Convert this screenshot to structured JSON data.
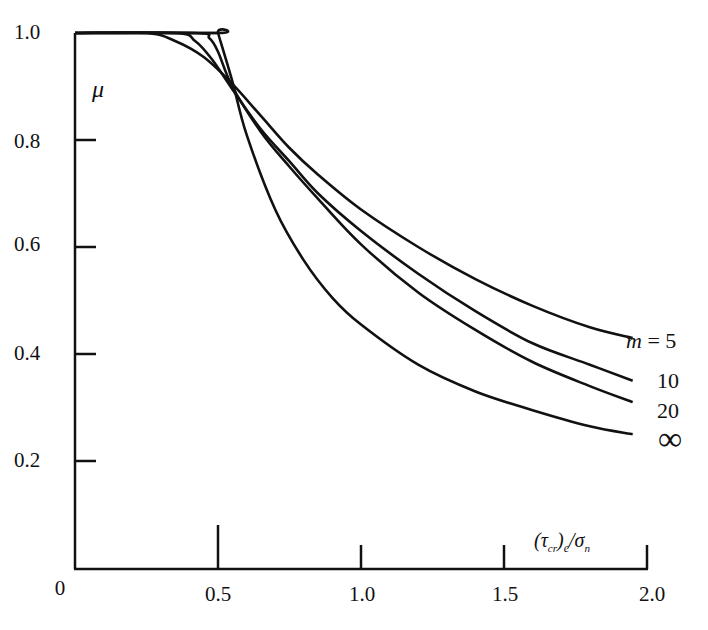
{
  "chart_data": {
    "type": "line",
    "title": "",
    "xlabel": "(τ_cr)_e/σ_n",
    "ylabel": "μ",
    "xlim": [
      0,
      2.0
    ],
    "ylim": [
      0,
      1.0
    ],
    "grid": false,
    "legend_position": "inline-right",
    "x_ticks": [
      "0",
      "0.5",
      "1.0",
      "1.5",
      "2.0"
    ],
    "y_ticks": [
      "0.2",
      "0.4",
      "0.6",
      "0.8",
      "1.0"
    ],
    "series": [
      {
        "name": "m = 5",
        "label": "m = 5",
        "x": [
          0,
          0.25,
          0.35,
          0.45,
          0.55,
          0.65,
          0.75,
          0.85,
          1.0,
          1.2,
          1.4,
          1.6,
          1.8,
          1.95
        ],
        "y": [
          1.0,
          1.0,
          0.985,
          0.955,
          0.905,
          0.845,
          0.785,
          0.735,
          0.67,
          0.6,
          0.54,
          0.49,
          0.45,
          0.43
        ]
      },
      {
        "name": "m = 10",
        "label": "10",
        "x": [
          0,
          0.35,
          0.42,
          0.48,
          0.55,
          0.65,
          0.75,
          0.85,
          1.0,
          1.2,
          1.4,
          1.6,
          1.8,
          1.95
        ],
        "y": [
          1.0,
          1.0,
          0.985,
          0.95,
          0.895,
          0.82,
          0.76,
          0.7,
          0.63,
          0.55,
          0.48,
          0.42,
          0.38,
          0.35
        ]
      },
      {
        "name": "m = 20",
        "label": "20",
        "x": [
          0,
          0.42,
          0.47,
          0.5,
          0.55,
          0.65,
          0.75,
          0.85,
          1.0,
          1.2,
          1.4,
          1.6,
          1.8,
          1.95
        ],
        "y": [
          1.0,
          1.0,
          0.99,
          0.965,
          0.9,
          0.815,
          0.75,
          0.69,
          0.605,
          0.515,
          0.445,
          0.385,
          0.34,
          0.31
        ]
      },
      {
        "name": "m = ∞",
        "label": "∞",
        "x": [
          0,
          0.5,
          0.5,
          0.55,
          0.6,
          0.7,
          0.8,
          0.9,
          1.0,
          1.2,
          1.4,
          1.6,
          1.8,
          1.95
        ],
        "y": [
          1.0,
          1.0,
          1.0,
          0.91,
          0.81,
          0.67,
          0.575,
          0.505,
          0.455,
          0.38,
          0.33,
          0.295,
          0.265,
          0.25
        ]
      }
    ]
  },
  "labels": {
    "y_axis_symbol": "μ",
    "x_axis_label_html": "(τcr)e/σn",
    "origin": "0"
  }
}
